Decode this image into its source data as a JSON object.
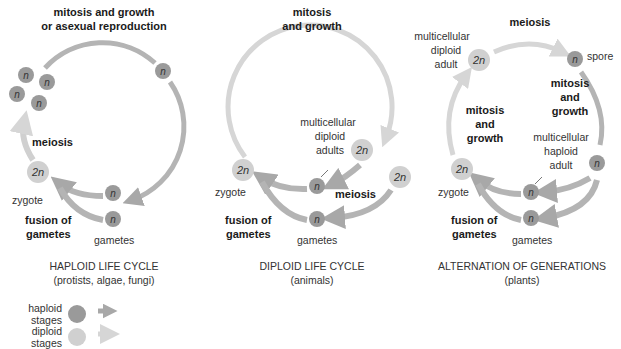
{
  "colors": {
    "haploid": "#9a9a9a",
    "haploid_arrow": "#a8a8a8",
    "diploid": "#d0d0d0",
    "diploid_arrow": "#d6d6d6",
    "text": "#333333"
  },
  "panels": [
    {
      "id": "haploid",
      "title": "HAPLOID LIFE CYCLE",
      "subtitle": "(protists, algae, fungi)",
      "labels": {
        "top": [
          "mitosis and growth",
          "or asexual reproduction"
        ],
        "meiosis": "meiosis",
        "zygote": "zygote",
        "fusion": [
          "fusion of",
          "gametes"
        ],
        "gametes": "gametes"
      },
      "cells": [
        {
          "ploidy": "n",
          "x": 26,
          "y": 75
        },
        {
          "ploidy": "n",
          "x": 47,
          "y": 82
        },
        {
          "ploidy": "n",
          "x": 17,
          "y": 94
        },
        {
          "ploidy": "n",
          "x": 39,
          "y": 103
        },
        {
          "ploidy": "n",
          "x": 163,
          "y": 71
        },
        {
          "ploidy": "2n",
          "x": 38,
          "y": 172
        },
        {
          "ploidy": "n",
          "x": 113,
          "y": 193
        },
        {
          "ploidy": "n",
          "x": 113,
          "y": 219
        }
      ]
    },
    {
      "id": "diploid",
      "title": "DIPLOID LIFE CYCLE",
      "subtitle": "(animals)",
      "labels": {
        "top": [
          "mitosis",
          "and growth"
        ],
        "adults": [
          "multicellular",
          "diploid",
          "adults"
        ],
        "meiosis": "meiosis",
        "zygote": "zygote",
        "fusion": [
          "fusion of",
          "gametes"
        ],
        "gametes": "gametes"
      },
      "cells": [
        {
          "ploidy": "2n",
          "x": 362,
          "y": 150
        },
        {
          "ploidy": "2n",
          "x": 400,
          "y": 177
        },
        {
          "ploidy": "2n",
          "x": 243,
          "y": 170
        },
        {
          "ploidy": "n",
          "x": 317,
          "y": 186
        },
        {
          "ploidy": "n",
          "x": 317,
          "y": 219
        }
      ]
    },
    {
      "id": "alternation",
      "title": "ALTERNATION OF GENERATIONS",
      "subtitle": "(plants)",
      "labels": {
        "top": "meiosis",
        "diploid_adult": [
          "multicellular",
          "diploid",
          "adult"
        ],
        "spore": "spore",
        "right_mitosis": [
          "mitosis",
          "and",
          "growth"
        ],
        "left_mitosis": [
          "mitosis",
          "and",
          "growth"
        ],
        "haploid_adult": [
          "multicellular",
          "haploid",
          "adult"
        ],
        "zygote": "zygote",
        "fusion": [
          "fusion of",
          "gametes"
        ],
        "gametes": "gametes"
      },
      "cells": [
        {
          "ploidy": "2n",
          "x": 479,
          "y": 60
        },
        {
          "ploidy": "n",
          "x": 575,
          "y": 59
        },
        {
          "ploidy": "n",
          "x": 597,
          "y": 163
        },
        {
          "ploidy": "2n",
          "x": 462,
          "y": 169
        },
        {
          "ploidy": "n",
          "x": 531,
          "y": 192
        },
        {
          "ploidy": "n",
          "x": 531,
          "y": 218
        }
      ]
    }
  ],
  "legend": [
    {
      "label": "haploid stages",
      "type": "haploid"
    },
    {
      "label": "diploid stages",
      "type": "diploid"
    }
  ]
}
